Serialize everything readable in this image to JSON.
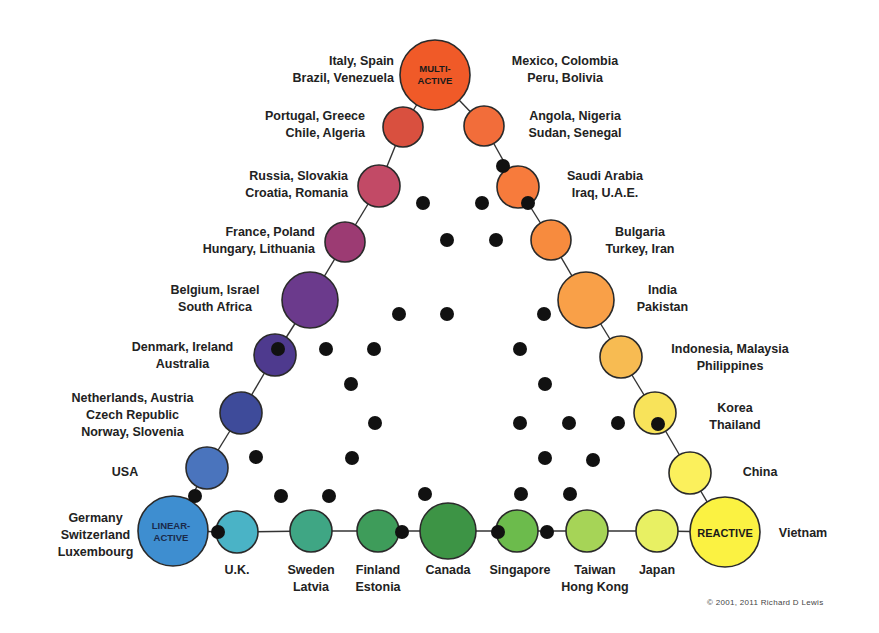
{
  "chart_data": {
    "type": "diagram",
    "vertices": {
      "top": {
        "label": "MULTI-ACTIVE",
        "countries": "Italy, Spain / Brazil, Venezuela / Mexico, Colombia / Peru, Bolivia"
      },
      "bottom_left": {
        "label": "LINEAR-ACTIVE",
        "countries": "Germany, Switzerland, Luxembourg"
      },
      "bottom_right": {
        "label": "REACTIVE",
        "countries": "Vietnam"
      }
    },
    "left_side": [
      "Portugal, Greece / Chile, Algeria",
      "Russia, Slovakia / Croatia, Romania",
      "France, Poland / Hungary, Lithuania",
      "Belgium, Israel / South Africa",
      "Denmark, Ireland / Australia",
      "Netherlands, Austria / Czech Republic / Norway, Slovenia",
      "USA"
    ],
    "right_side": [
      "Angola, Nigeria / Sudan, Senegal",
      "Saudi Arabia / Iraq, U.A.E.",
      "Bulgaria / Turkey, Iran",
      "India / Pakistan",
      "Indonesia, Malaysia / Philippines",
      "Korea / Thailand",
      "China"
    ],
    "bottom_side": [
      "U.K.",
      "Sweden / Latvia",
      "Finland / Estonia",
      "Canada",
      "Singapore",
      "Taiwan / Hong Kong",
      "Japan"
    ]
  },
  "vertex_labels": {
    "multi_active": [
      "MULTI-",
      "ACTIVE"
    ],
    "linear_active": [
      "LINEAR-",
      "ACTIVE"
    ],
    "reactive": "REACTIVE"
  },
  "nodes": [
    {
      "id": "multi",
      "cx": 435,
      "cy": 75,
      "r": 35,
      "color": "#f05a28"
    },
    {
      "id": "portugal",
      "cx": 403,
      "cy": 127,
      "r": 20,
      "color": "#d9503f"
    },
    {
      "id": "angola",
      "cx": 484,
      "cy": 126,
      "r": 20,
      "color": "#f26d3a"
    },
    {
      "id": "russia",
      "cx": 379,
      "cy": 186,
      "r": 21,
      "color": "#c24a66"
    },
    {
      "id": "saudi",
      "cx": 518,
      "cy": 187,
      "r": 21,
      "color": "#f77b3c"
    },
    {
      "id": "france",
      "cx": 345,
      "cy": 242,
      "r": 20,
      "color": "#9c3b73"
    },
    {
      "id": "bulgaria",
      "cx": 551,
      "cy": 240,
      "r": 20,
      "color": "#f78b3e"
    },
    {
      "id": "belgium",
      "cx": 310,
      "cy": 300,
      "r": 28,
      "color": "#6b3a8c"
    },
    {
      "id": "india",
      "cx": 586,
      "cy": 300,
      "r": 28,
      "color": "#f9a048"
    },
    {
      "id": "denmark",
      "cx": 275,
      "cy": 355,
      "r": 21,
      "color": "#4e3a8e"
    },
    {
      "id": "indonesia",
      "cx": 621,
      "cy": 357,
      "r": 21,
      "color": "#f7bb52"
    },
    {
      "id": "netherlands",
      "cx": 241,
      "cy": 413,
      "r": 21,
      "color": "#3e4b9a"
    },
    {
      "id": "korea",
      "cx": 655,
      "cy": 413,
      "r": 21,
      "color": "#f8e35a"
    },
    {
      "id": "usa",
      "cx": 207,
      "cy": 468,
      "r": 21,
      "color": "#4a74bd"
    },
    {
      "id": "china",
      "cx": 690,
      "cy": 473,
      "r": 21,
      "color": "#fbf05c"
    },
    {
      "id": "linear",
      "cx": 173,
      "cy": 531,
      "r": 35,
      "color": "#3e8ed0"
    },
    {
      "id": "uk",
      "cx": 237,
      "cy": 532,
      "r": 21,
      "color": "#4ab3c6"
    },
    {
      "id": "sweden",
      "cx": 311,
      "cy": 531,
      "r": 21,
      "color": "#3fa684"
    },
    {
      "id": "finland",
      "cx": 378,
      "cy": 531,
      "r": 21,
      "color": "#3e9c5a"
    },
    {
      "id": "canada",
      "cx": 448,
      "cy": 531,
      "r": 28,
      "color": "#3d9445"
    },
    {
      "id": "singapore",
      "cx": 517,
      "cy": 531,
      "r": 21,
      "color": "#6cbb4c"
    },
    {
      "id": "taiwan",
      "cx": 587,
      "cy": 531,
      "r": 21,
      "color": "#a6d457"
    },
    {
      "id": "japan",
      "cx": 657,
      "cy": 531,
      "r": 21,
      "color": "#e8f063"
    },
    {
      "id": "reactive",
      "cx": 725,
      "cy": 532,
      "r": 35,
      "color": "#fbf242"
    }
  ],
  "dots": [
    [
      503,
      166
    ],
    [
      528,
      203
    ],
    [
      423,
      203
    ],
    [
      482,
      203
    ],
    [
      447,
      240
    ],
    [
      496,
      240
    ],
    [
      399,
      314
    ],
    [
      447,
      314
    ],
    [
      544,
      314
    ],
    [
      278,
      349
    ],
    [
      326,
      349
    ],
    [
      374,
      349
    ],
    [
      520,
      349
    ],
    [
      351,
      384
    ],
    [
      545,
      384
    ],
    [
      375,
      423
    ],
    [
      520,
      423
    ],
    [
      569,
      423
    ],
    [
      618,
      423
    ],
    [
      658,
      424
    ],
    [
      256,
      457
    ],
    [
      352,
      458
    ],
    [
      545,
      458
    ],
    [
      593,
      460
    ],
    [
      195,
      496
    ],
    [
      281,
      496
    ],
    [
      329,
      496
    ],
    [
      425,
      494
    ],
    [
      521,
      494
    ],
    [
      570,
      494
    ],
    [
      218,
      532
    ],
    [
      402,
      532
    ],
    [
      498,
      532
    ],
    [
      547,
      532
    ]
  ],
  "labels": {
    "italy": [
      "Italy, Spain",
      "Brazil, Venezuela"
    ],
    "mexico": [
      "Mexico, Colombia",
      "Peru, Bolivia"
    ],
    "portugal": [
      "Portugal, Greece",
      "Chile, Algeria"
    ],
    "angola": [
      "Angola, Nigeria",
      "Sudan, Senegal"
    ],
    "russia": [
      "Russia, Slovakia",
      "Croatia, Romania"
    ],
    "saudi": [
      "Saudi Arabia",
      "Iraq, U.A.E."
    ],
    "france": [
      "France, Poland",
      "Hungary, Lithuania"
    ],
    "bulgaria": [
      "Bulgaria",
      "Turkey, Iran"
    ],
    "belgium": [
      "Belgium, Israel",
      "South Africa"
    ],
    "india": [
      "India",
      "Pakistan"
    ],
    "denmark": [
      "Denmark, Ireland",
      "Australia"
    ],
    "indonesia": [
      "Indonesia, Malaysia",
      "Philippines"
    ],
    "netherlands": [
      "Netherlands, Austria",
      "Czech Republic",
      "Norway, Slovenia"
    ],
    "korea": [
      "Korea",
      "Thailand"
    ],
    "usa": [
      "USA"
    ],
    "china": [
      "China"
    ],
    "germany": [
      "Germany",
      "Switzerland",
      "Luxembourg"
    ],
    "vietnam": [
      "Vietnam"
    ],
    "uk": [
      "U.K."
    ],
    "sweden": [
      "Sweden",
      "Latvia"
    ],
    "finland": [
      "Finland",
      "Estonia"
    ],
    "canada": [
      "Canada"
    ],
    "singapore": [
      "Singapore"
    ],
    "taiwan": [
      "Taiwan",
      "Hong Kong"
    ],
    "japan": [
      "Japan"
    ]
  },
  "copyright": "© 2001, 2011 Richard D Lewis"
}
